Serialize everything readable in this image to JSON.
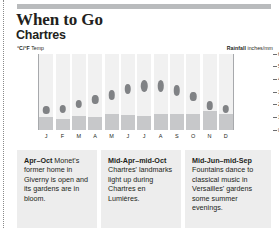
{
  "header": {
    "title": "When to Go",
    "subtitle": "Chartres"
  },
  "axes": {
    "temp_caption_lead": "°C/°F",
    "temp_caption_rest": " Temp",
    "rain_caption_lead": "Rainfall",
    "rain_caption_rest": " inches/mm"
  },
  "captions": [
    {
      "term": "Apr–Oct",
      "text": " Monet's former home in Giverny is open and its gardens are in bloom."
    },
    {
      "term": "Mid-Apr–mid-Oct",
      "text": " Chartres' landmarks light up during Chartres en Lumières."
    },
    {
      "term": "Mid-Jun–mid-Sep",
      "text": " Fountains dance to classical music in Versailles' gardens some summer evenings."
    }
  ],
  "chart_data": {
    "type": "bar",
    "xlabel": "",
    "ylabel": "°C/°F Temp",
    "y2label": "Rainfall inches/mm",
    "grid": false,
    "legend": "none",
    "categories": [
      "J",
      "F",
      "M",
      "A",
      "M",
      "J",
      "J",
      "A",
      "S",
      "O",
      "N",
      "D"
    ],
    "left_axis": {
      "label": "°C/°F Temp",
      "ticks": [
        "40/104",
        "30/86",
        "20/68",
        "10/50",
        "0/32",
        "-10/14"
      ],
      "tick_values": [
        40,
        30,
        20,
        10,
        0,
        -10
      ],
      "ylim": [
        -10,
        40
      ]
    },
    "right_axis": {
      "label": "Rainfall inches/mm",
      "ticks": [
        "6/150",
        "5/125",
        "4/100",
        "3/75",
        "2/50",
        "1/25",
        "0"
      ],
      "tick_values": [
        6,
        5,
        4,
        3,
        2,
        1,
        0
      ],
      "ylim": [
        0,
        6
      ]
    },
    "series": [
      {
        "name": "Temperature",
        "unit": "°C",
        "type": "scatter",
        "values": [
          3,
          4,
          7,
          10,
          13,
          17,
          19,
          19,
          16,
          12,
          6,
          4
        ]
      },
      {
        "name": "Rainfall",
        "unit": "inches",
        "type": "bar",
        "values": [
          1.0,
          0.9,
          1.1,
          1.0,
          1.3,
          1.2,
          1.1,
          1.3,
          1.3,
          1.3,
          1.5,
          1.3
        ]
      }
    ]
  },
  "colors": {
    "bar_grey": "#b9bbbd",
    "dot_grey": "#808285",
    "rain_bar": "#c7c8ca",
    "column_bg": "#f1f1f1",
    "caption_bg": "#ededed",
    "text": "#231f20"
  }
}
